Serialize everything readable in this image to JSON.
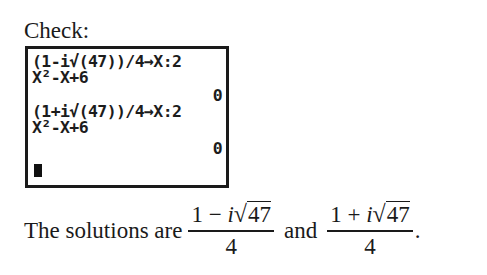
{
  "heading": "Check:",
  "calculator": {
    "lines": [
      {
        "text": "(1-i√(47))/4→X:2",
        "align": "left"
      },
      {
        "text": "X²-X+6",
        "align": "left"
      },
      {
        "text": "0",
        "align": "right"
      },
      {
        "text": "(1+i√(47))/4→X:2",
        "align": "left"
      },
      {
        "text": "X²-X+6",
        "align": "left"
      },
      {
        "text": "0",
        "align": "right"
      }
    ],
    "cursor": "block-cursor"
  },
  "conclusion": {
    "prefix": "The solutions are",
    "solution1": {
      "numerator_left": "1 − ",
      "i": "i",
      "radical": "√",
      "radicand": "47",
      "denominator": "4"
    },
    "conjunction": "and",
    "solution2": {
      "numerator_left": "1 + ",
      "i": "i",
      "radical": "√",
      "radicand": "47",
      "denominator": "4"
    },
    "suffix": "."
  }
}
